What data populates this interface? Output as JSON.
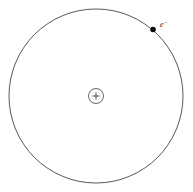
{
  "diagram": {
    "background_color": "#ffffff",
    "width": 193,
    "height": 192,
    "orbit": {
      "name": "electron-orbit",
      "center_x": 96,
      "center_y": 96,
      "radius": 87,
      "stroke_color": "#444444",
      "stroke_width": 0.9,
      "fill": "none"
    },
    "nucleus": {
      "name": "nucleus",
      "center_x": 96,
      "center_y": 96,
      "radius": 7.5,
      "charge_symbol": "+",
      "stroke_color": "#555555",
      "fill_color": "#ffffff"
    },
    "electron": {
      "name": "electron",
      "center_x": 153,
      "center_y": 29.5,
      "radius": 2.8,
      "fill_color": "#0b0b0b",
      "label_base": "e",
      "label_superscript": "−",
      "label_full": "e⁻",
      "label_x": 160,
      "label_y": 27
    }
  }
}
